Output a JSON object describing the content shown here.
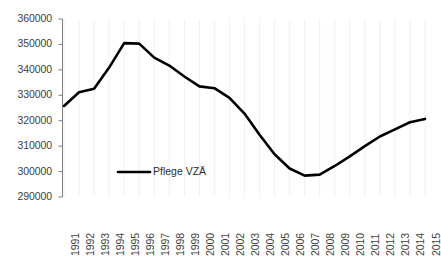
{
  "chart_data": {
    "type": "line",
    "title": "",
    "subtitle": "",
    "xlabel": "",
    "ylabel": "",
    "categories": [
      "1991",
      "1992",
      "1993",
      "1994",
      "1995",
      "1996",
      "1997",
      "1998",
      "1999",
      "2000",
      "2001",
      "2002",
      "2003",
      "2004",
      "2005",
      "2006",
      "2007",
      "2008",
      "2009",
      "2010",
      "2011",
      "2012",
      "2013",
      "2014",
      "2015"
    ],
    "series": [
      {
        "name": "Pflege VZÄ",
        "color": "#000000",
        "values": [
          325800,
          331200,
          332600,
          340900,
          350500,
          350300,
          344800,
          341700,
          337400,
          333500,
          332800,
          329000,
          322800,
          314500,
          306800,
          301200,
          298400,
          298800,
          302200,
          306000,
          310000,
          313800,
          316600,
          319400,
          320700
        ]
      }
    ],
    "ytick_labels": [
      "360000",
      "350000",
      "340000",
      "330000",
      "320000",
      "310000",
      "300000",
      "290000"
    ],
    "ytick_values": [
      360000,
      350000,
      340000,
      330000,
      320000,
      310000,
      300000,
      290000
    ],
    "ylim": [
      290000,
      360000
    ],
    "xlim": [
      "1991",
      "2015"
    ],
    "grid": {
      "horizontal": false,
      "vertical": true,
      "color": "#f0f0f0"
    },
    "legend": {
      "position": "inside-left",
      "entries": [
        {
          "label": "Pflege VZÄ",
          "color": "#000000"
        }
      ]
    },
    "axis": {
      "line_color": "#7f7f7f",
      "tick_color": "#7f7f7f",
      "label_color": "#404040"
    }
  }
}
